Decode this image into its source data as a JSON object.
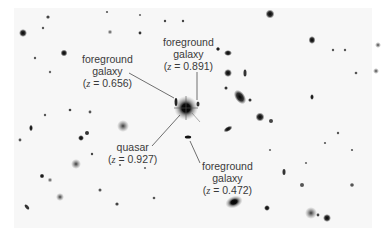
{
  "figure": {
    "background": "#ffffff",
    "labels": [
      {
        "id": "fg-galaxy-1",
        "lines": [
          "foreground",
          "galaxy"
        ],
        "z_prefix": "z",
        "z_value": "= 0.656",
        "redshift": 0.656
      },
      {
        "id": "fg-galaxy-2",
        "lines": [
          "foreground",
          "galaxy"
        ],
        "z_prefix": "z",
        "z_value": "= 0.891",
        "redshift": 0.891
      },
      {
        "id": "quasar",
        "lines": [
          "quasar"
        ],
        "z_prefix": "z",
        "z_value": "= 0.927",
        "redshift": 0.927
      },
      {
        "id": "fg-galaxy-3",
        "lines": [
          "foreground",
          "galaxy"
        ],
        "z_prefix": "z",
        "z_value": "= 0.472",
        "redshift": 0.472
      }
    ]
  }
}
